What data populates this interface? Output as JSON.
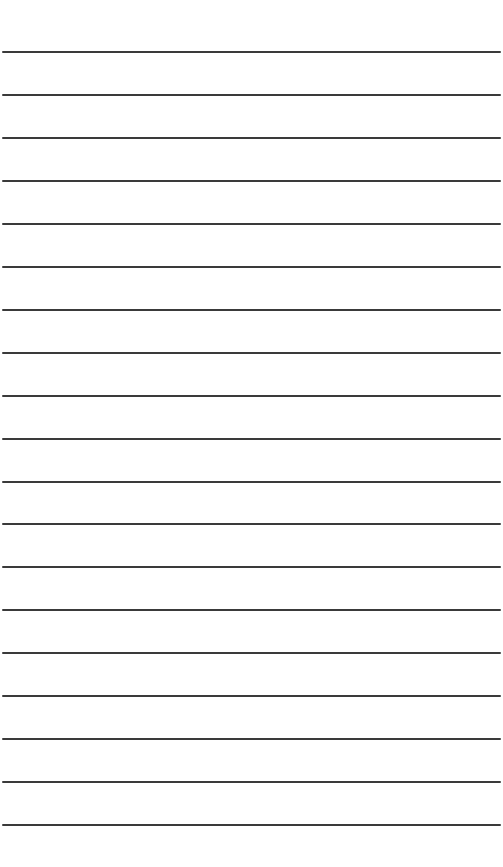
{
  "page": {
    "type": "lined-paper",
    "background_color": "#ffffff",
    "line_color": "#3a3a3a",
    "line_count": 19,
    "first_line_y": 52,
    "line_spacing": 42.95,
    "line_thickness": 2
  }
}
